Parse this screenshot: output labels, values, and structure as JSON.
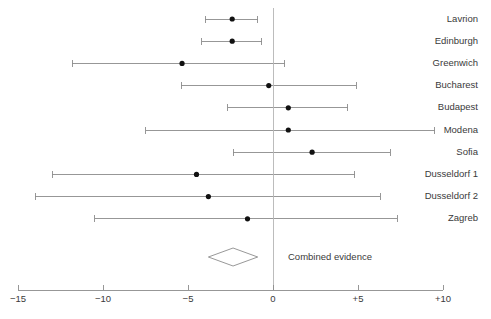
{
  "chart_data": {
    "type": "forest",
    "title": "",
    "subtitle": "",
    "xlabel": "",
    "ylabel": "",
    "xlim": [
      -15,
      10
    ],
    "grid": false,
    "legend_position": "none",
    "zero_reference": 0,
    "xticks": [
      -15,
      -10,
      -5,
      0,
      5,
      10
    ],
    "xtick_labels": [
      "−15",
      "−10",
      "−5",
      "0",
      "+5",
      "+10"
    ],
    "label_side": "right",
    "series_name": "Treatment effect",
    "rows": [
      {
        "label": "Lavrion",
        "estimate": -2.4,
        "ci_low": -4.0,
        "ci_high": -0.9
      },
      {
        "label": "Edinburgh",
        "estimate": -2.4,
        "ci_low": -4.2,
        "ci_high": -0.65
      },
      {
        "label": "Greenwich",
        "estimate": -5.35,
        "ci_low": -11.8,
        "ci_high": 0.7
      },
      {
        "label": "Bucharest",
        "estimate": -0.25,
        "ci_low": -5.4,
        "ci_high": 4.9
      },
      {
        "label": "Budapest",
        "estimate": 0.9,
        "ci_low": -2.65,
        "ci_high": 4.4
      },
      {
        "label": "Modena",
        "estimate": 0.9,
        "ci_low": -7.5,
        "ci_high": 9.5
      },
      {
        "label": "Sofia",
        "estimate": 2.3,
        "ci_low": -2.35,
        "ci_high": 6.9
      },
      {
        "label": "Dusseldorf 1",
        "estimate": -4.5,
        "ci_low": -13.0,
        "ci_high": 4.8
      },
      {
        "label": "Dusseldorf 2",
        "estimate": -3.8,
        "ci_low": -14.0,
        "ci_high": 6.3
      },
      {
        "label": "Zagreb",
        "estimate": -1.5,
        "ci_low": -10.5,
        "ci_high": 7.3
      }
    ],
    "summary": {
      "label": "Combined evidence",
      "estimate": -2.35,
      "ci_low": -3.8,
      "ci_high": -0.9
    },
    "colors": {
      "line": "#8c8c8c",
      "point": "#111111",
      "zero_line": "#b5b5b5",
      "axis": "#8c8c8c",
      "text": "#3a3a3a",
      "background": "#ffffff"
    }
  }
}
